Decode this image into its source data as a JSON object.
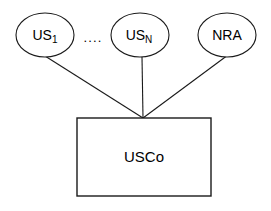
{
  "diagram": {
    "type": "ownership-structure-diagram",
    "background_color": "#ffffff",
    "stroke_color": "#1a1a1a",
    "text_color": "#000000",
    "nodes": [
      {
        "id": "us1",
        "shape": "ellipse",
        "label_base": "US",
        "label_subscript": "1",
        "cx": 45,
        "cy": 35,
        "rx": 29,
        "ry": 22
      },
      {
        "id": "usn",
        "shape": "ellipse",
        "label_base": "US",
        "label_subscript": "N",
        "cx": 140,
        "cy": 35,
        "rx": 29,
        "ry": 22
      },
      {
        "id": "nra",
        "shape": "ellipse",
        "label_base": "NRA",
        "label_subscript": "",
        "cx": 227,
        "cy": 35,
        "rx": 29,
        "ry": 22
      }
    ],
    "box": {
      "id": "usco",
      "shape": "rectangle",
      "label": "USCo",
      "x": 77,
      "y": 118,
      "width": 134,
      "height": 78
    },
    "ellipsis": {
      "text": "....",
      "x": 93,
      "y": 38
    },
    "edges": [
      {
        "from": "us1",
        "to": "usco",
        "x1": 45,
        "y1": 56,
        "x2": 143,
        "y2": 118
      },
      {
        "from": "usn",
        "to": "usco",
        "x1": 142,
        "y1": 57,
        "x2": 143,
        "y2": 118
      },
      {
        "from": "nra",
        "to": "usco",
        "x1": 228,
        "y1": 55,
        "x2": 143,
        "y2": 118
      }
    ]
  }
}
